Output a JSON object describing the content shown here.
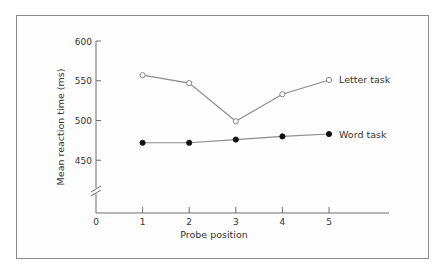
{
  "chart_data": {
    "type": "line",
    "title": "",
    "xlabel": "Probe position",
    "ylabel": "Mean reaction time (ms)",
    "x": [
      1,
      2,
      3,
      4,
      5
    ],
    "x_ticks": [
      "0",
      "1",
      "2",
      "3",
      "4",
      "5"
    ],
    "y_ticks": [
      "600",
      "550",
      "500",
      "450"
    ],
    "ylim": [
      450,
      600
    ],
    "y_axis_break": true,
    "grid": false,
    "legend_position": "inline-right",
    "series": [
      {
        "name": "Letter task",
        "marker": "open-circle",
        "values": [
          557,
          547,
          499,
          533,
          551
        ]
      },
      {
        "name": "Word task",
        "marker": "filled-circle",
        "values": [
          472,
          472,
          476,
          480,
          483
        ]
      }
    ]
  },
  "colors": {
    "line": "#8c8c8c",
    "axis": "#6e6e6e",
    "frame": "#8a8a8a",
    "text": "#333333"
  }
}
